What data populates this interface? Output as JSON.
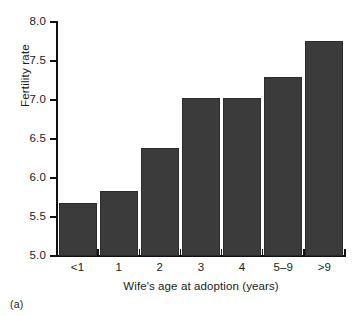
{
  "chart_data": {
    "type": "bar",
    "title": "",
    "subtitle": "",
    "xlabel": "Wife's age at adoption (years)",
    "ylabel": "Fertility rate",
    "categories": [
      "<1",
      "1",
      "2",
      "3",
      "4",
      "5–9",
      ">9"
    ],
    "values": [
      5.68,
      5.83,
      6.38,
      7.03,
      7.03,
      7.3,
      7.76
    ],
    "series": [
      {
        "name": "Fertility rate",
        "values": [
          5.68,
          5.83,
          6.38,
          7.03,
          7.03,
          7.3,
          7.76
        ]
      }
    ],
    "ylim": [
      5.0,
      8.0
    ],
    "ytick_values": [
      5.0,
      5.5,
      6.0,
      6.5,
      7.0,
      7.5,
      8.0
    ],
    "ytick_labels": [
      "5.0",
      "5.5",
      "6.0",
      "6.5",
      "7.0",
      "7.5",
      "8.0"
    ],
    "grid": false,
    "legend": false,
    "legend_position": "none",
    "bar_color": "#3b3b3b",
    "axis_color": "#111111",
    "background_color": "#ffffff"
  },
  "figure": {
    "panel_caption": "(a)"
  }
}
